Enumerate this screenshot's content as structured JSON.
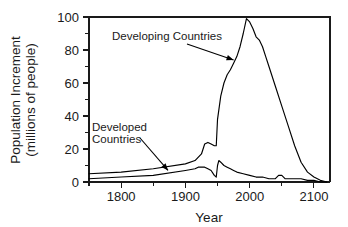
{
  "chart_data": {
    "type": "line",
    "title": "",
    "xlabel": "Year",
    "ylabel": "Population Increment\n(millions of people)",
    "ylabel_line1": "Population Increment",
    "ylabel_line2": "(millions of people)",
    "xlim": [
      1750,
      2125
    ],
    "ylim": [
      0,
      100
    ],
    "grid": false,
    "legend": "none (inline annotations with arrows)",
    "x_ticks_major": [
      1800,
      1900,
      2000,
      2100
    ],
    "x_tick_labels": [
      "1800",
      "1900",
      "2000",
      "2100"
    ],
    "x_ticks_minor": [
      1750,
      1850,
      1950,
      2050
    ],
    "y_ticks_major": [
      0,
      20,
      40,
      60,
      80,
      100
    ],
    "y_tick_labels": [
      "0",
      "20",
      "40",
      "60",
      "80",
      "100"
    ],
    "y_ticks_minor": [
      10,
      30,
      50,
      70,
      90
    ],
    "series": [
      {
        "name": "Developing Countries",
        "x": [
          1750,
          1800,
          1850,
          1900,
          1915,
          1925,
          1930,
          1935,
          1940,
          1945,
          1948,
          1950,
          1955,
          1960,
          1965,
          1970,
          1975,
          1980,
          1985,
          1990,
          1995,
          2000,
          2005,
          2010,
          2015,
          2020,
          2025,
          2030,
          2040,
          2050,
          2060,
          2070,
          2080,
          2090,
          2100,
          2110,
          2120
        ],
        "values": [
          5,
          6,
          8,
          11,
          13,
          17,
          23,
          24,
          23,
          22,
          22,
          38,
          52,
          60,
          65,
          68,
          72,
          76,
          82,
          90,
          99,
          97,
          93,
          88,
          86,
          82,
          76,
          70,
          58,
          46,
          34,
          22,
          12,
          6,
          3,
          1,
          0
        ]
      },
      {
        "name": "Developed Countries",
        "x": [
          1750,
          1800,
          1850,
          1900,
          1915,
          1920,
          1925,
          1930,
          1935,
          1940,
          1945,
          1948,
          1950,
          1952,
          1955,
          1960,
          1965,
          1970,
          1975,
          1980,
          1990,
          2000,
          2010,
          2020,
          2030,
          2040,
          2045,
          2050,
          2055,
          2060,
          2070,
          2080,
          2090,
          2100,
          2110,
          2120
        ],
        "values": [
          2,
          3,
          4,
          7,
          8,
          9,
          9,
          9,
          8,
          7,
          4,
          3,
          10,
          13,
          12,
          10,
          9,
          8,
          7,
          6,
          5,
          4,
          3,
          3,
          2,
          2,
          4,
          4,
          2,
          2,
          2,
          2,
          1,
          1,
          0,
          0
        ]
      }
    ],
    "annotations": [
      {
        "name": "developing-countries",
        "text": "Developing Countries",
        "lines": [
          "Developing Countries"
        ],
        "arrow_from_year": 1870,
        "arrow_to_year": 1975,
        "arrow_to_value": 74
      },
      {
        "name": "developed-countries",
        "text": "Developed Countries",
        "lines": [
          "Developed",
          "Countries"
        ],
        "arrow_from_year": 1845,
        "arrow_to_year": 1873,
        "arrow_to_value": 7
      }
    ],
    "colors": {
      "line": "#000000",
      "axis": "#1a1a1a",
      "background": "#ffffff",
      "text": "#1a1a1a"
    }
  }
}
